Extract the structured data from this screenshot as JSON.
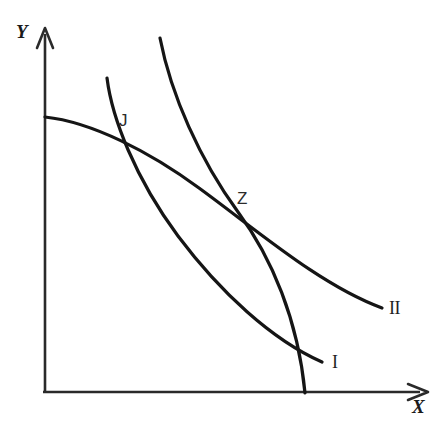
{
  "figure": {
    "background_color": "#ffffff",
    "stroke_color": "#151515",
    "axis_color": "#2a2a2a"
  },
  "axes": {
    "y_label": "Y",
    "x_label": "X",
    "origin": [
      43,
      393
    ],
    "y_axis_top": [
      45,
      28
    ],
    "x_axis_right": [
      428,
      392
    ]
  },
  "labels": {
    "point_j": "J",
    "point_z": "Z",
    "curve_one": "I",
    "curve_two": "II"
  },
  "chart_data": {
    "type": "line",
    "title": "",
    "xlabel": "X",
    "ylabel": "Y",
    "grid": false,
    "legend": "inline-end-labels",
    "xlim": [
      0,
      445
    ],
    "ylim": [
      0,
      439
    ],
    "annotations": [
      {
        "text": "J",
        "x": 117,
        "y": 137,
        "note": "intersection of curve I and curve II"
      },
      {
        "text": "Z",
        "x": 238,
        "y": 212,
        "note": "tangency of constraint curve and curve II"
      },
      {
        "text": "I",
        "x": 337,
        "y": 364,
        "note": "end label of lower indifference curve"
      },
      {
        "text": "II",
        "x": 398,
        "y": 310,
        "note": "end label of upper indifference curve"
      }
    ],
    "series": [
      {
        "name": "I",
        "label": "I",
        "description": "lower convex indifference curve from upper-left to lower-right",
        "path": "M 107,78 C 112,118 135,178 178,236 C 220,292 272,340 322,362",
        "points": [
          [
            107,
            78
          ],
          [
            117,
            137
          ],
          [
            150,
            196
          ],
          [
            196,
            261
          ],
          [
            250,
            314
          ],
          [
            303,
            355
          ],
          [
            322,
            362
          ]
        ]
      },
      {
        "name": "II",
        "label": "II",
        "description": "upper convex indifference curve, flat near Y axis, flattening to the right",
        "path": "M 45,117 C 92,122 150,152 199,188 C 258,231 320,285 382,308",
        "points": [
          [
            45,
            117
          ],
          [
            80,
            122
          ],
          [
            117,
            137
          ],
          [
            160,
            161
          ],
          [
            199,
            188
          ],
          [
            238,
            212
          ],
          [
            290,
            257
          ],
          [
            340,
            291
          ],
          [
            382,
            308
          ]
        ]
      },
      {
        "name": "constraint",
        "label": "",
        "description": "steep downward curve tangent to curve II at Z, meeting the X axis",
        "path": "M 160,38 C 171,95 200,160 238,212 C 272,258 298,320 305,393",
        "points": [
          [
            160,
            38
          ],
          [
            172,
            100
          ],
          [
            196,
            155
          ],
          [
            219,
            187
          ],
          [
            238,
            212
          ],
          [
            268,
            254
          ],
          [
            290,
            305
          ],
          [
            300,
            352
          ],
          [
            305,
            393
          ]
        ]
      }
    ]
  }
}
